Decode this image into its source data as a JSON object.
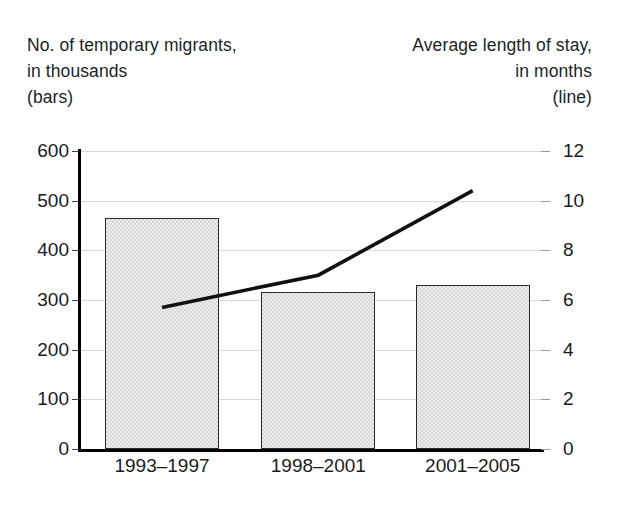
{
  "header": {
    "left": {
      "line1": "No. of temporary migrants,",
      "line2": "in thousands",
      "line3": "(bars)"
    },
    "right": {
      "line1": "Average length of stay,",
      "line2": "in months",
      "line3": "(line)"
    }
  },
  "chart_data": {
    "type": "bar",
    "title": "",
    "subtitle": "",
    "categories": [
      "1993–1997",
      "1998–2001",
      "2001–2005"
    ],
    "series": [
      {
        "name": "No. of temporary migrants, in thousands (bars)",
        "type": "bar",
        "axis": "left",
        "values": [
          465,
          317,
          330
        ]
      },
      {
        "name": "Average length of stay, in months (line)",
        "type": "line",
        "axis": "right",
        "values": [
          5.7,
          7.0,
          10.4
        ]
      }
    ],
    "xlabel": "",
    "ylabel": "No. of temporary migrants, in thousands",
    "y2label": "Average length of stay, in months",
    "ylim": [
      0,
      600
    ],
    "y2lim": [
      0,
      12
    ],
    "yticks": [
      0,
      100,
      200,
      300,
      400,
      500,
      600
    ],
    "y2ticks": [
      0,
      2,
      4,
      6,
      8,
      10,
      12
    ],
    "ytick_labels": [
      "0",
      "100",
      "200",
      "300",
      "400",
      "500",
      "600"
    ],
    "y2tick_labels": [
      "0",
      "2",
      "4",
      "6",
      "8",
      "10",
      "12"
    ],
    "grid": true,
    "legend": "none",
    "colors": {
      "bar_fill": "#d7d7d7",
      "bar_border": "#2a2a2a",
      "line": "#111111",
      "grid": "#d9d9d9",
      "axis": "#000000"
    }
  }
}
